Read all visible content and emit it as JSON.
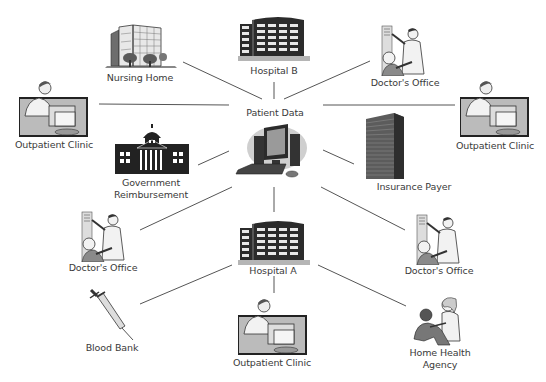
{
  "diagram": {
    "type": "hub-and-spoke network",
    "hub": {
      "id": "patient-data",
      "label": "Patient Data",
      "icon": "computer-icon"
    },
    "nodes": [
      {
        "id": "nursing-home",
        "label": "Nursing Home",
        "icon": "building-icon"
      },
      {
        "id": "hospital-b",
        "label": "Hospital B",
        "icon": "hospital-icon"
      },
      {
        "id": "doctors-office-top",
        "label": "Doctor's Office",
        "icon": "doctor-patient-icon"
      },
      {
        "id": "outpatient-clinic-left",
        "label": "Outpatient Clinic",
        "icon": "clinician-computer-icon"
      },
      {
        "id": "outpatient-clinic-right",
        "label": "Outpatient Clinic",
        "icon": "clinician-computer-icon"
      },
      {
        "id": "government-reimbursement",
        "label_lines": [
          "Government",
          "Reimbursement"
        ],
        "icon": "capitol-building-icon"
      },
      {
        "id": "insurance-payer",
        "label": "Insurance Payer",
        "icon": "skyscraper-icon"
      },
      {
        "id": "doctors-office-left",
        "label": "Doctor's Office",
        "icon": "doctor-patient-icon"
      },
      {
        "id": "hospital-a",
        "label": "Hospital A",
        "icon": "hospital-icon"
      },
      {
        "id": "doctors-office-right",
        "label": "Doctor's Office",
        "icon": "doctor-patient-icon"
      },
      {
        "id": "blood-bank",
        "label": "Blood Bank",
        "icon": "syringe-icon"
      },
      {
        "id": "outpatient-clinic-bottom",
        "label": "Outpatient Clinic",
        "icon": "clinician-computer-icon"
      },
      {
        "id": "home-health-agency",
        "label_lines": [
          "Home Health",
          "Agency"
        ],
        "icon": "nurse-patient-icon"
      }
    ],
    "edges": [
      [
        "patient-data",
        "nursing-home"
      ],
      [
        "patient-data",
        "hospital-b"
      ],
      [
        "patient-data",
        "doctors-office-top"
      ],
      [
        "patient-data",
        "outpatient-clinic-left"
      ],
      [
        "patient-data",
        "outpatient-clinic-right"
      ],
      [
        "patient-data",
        "government-reimbursement"
      ],
      [
        "patient-data",
        "insurance-payer"
      ],
      [
        "patient-data",
        "doctors-office-left"
      ],
      [
        "patient-data",
        "hospital-a"
      ],
      [
        "patient-data",
        "doctors-office-right"
      ],
      [
        "hospital-a",
        "blood-bank"
      ],
      [
        "hospital-a",
        "outpatient-clinic-bottom"
      ],
      [
        "hospital-a",
        "home-health-agency"
      ]
    ]
  },
  "labels": {
    "nursing_home": "Nursing Home",
    "hospital_b": "Hospital B",
    "doctors_office_top": "Doctor's Office",
    "outpatient_clinic_left": "Outpatient Clinic",
    "outpatient_clinic_right": "Outpatient Clinic",
    "patient_data": "Patient Data",
    "government_line1": "Government",
    "government_line2": "Reimbursement",
    "insurance_payer": "Insurance Payer",
    "doctors_office_left": "Doctor's Office",
    "hospital_a": "Hospital A",
    "doctors_office_right": "Doctor's Office",
    "blood_bank": "Blood Bank",
    "outpatient_clinic_bottom": "Outpatient Clinic",
    "home_health_line1": "Home Health",
    "home_health_line2": "Agency"
  },
  "colors": {
    "line": "#555555",
    "icon_dark": "#2b2b2b",
    "icon_mid": "#8a8a8a",
    "icon_light": "#d6d6d6",
    "label_text": "#3a3a3a",
    "background": "#ffffff"
  }
}
